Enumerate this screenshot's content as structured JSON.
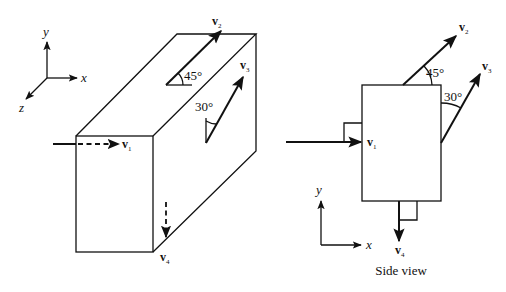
{
  "figure": {
    "left_view": {
      "axes": {
        "x": "x",
        "y": "y",
        "z": "z"
      },
      "vectors": {
        "v1": {
          "base": "v",
          "sub": "1"
        },
        "v2": {
          "base": "v",
          "sub": "2",
          "angle": "45°"
        },
        "v3": {
          "base": "v",
          "sub": "3",
          "angle": "30°"
        },
        "v4": {
          "base": "v",
          "sub": "4"
        }
      }
    },
    "side_view": {
      "caption": "Side view",
      "axes": {
        "x": "x",
        "y": "y"
      },
      "vectors": {
        "v1": {
          "base": "v",
          "sub": "1"
        },
        "v2": {
          "base": "v",
          "sub": "2",
          "angle": "45°"
        },
        "v3": {
          "base": "v",
          "sub": "3",
          "angle": "30°"
        },
        "v4": {
          "base": "v",
          "sub": "4"
        }
      }
    }
  }
}
